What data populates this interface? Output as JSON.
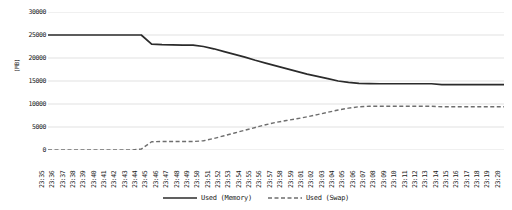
{
  "chart_data": {
    "type": "line",
    "title": "",
    "xlabel": "",
    "ylabel": "(MB)",
    "ylim": [
      0,
      30000
    ],
    "ytick_labels": [
      "30000",
      "25000",
      "20000",
      "15000",
      "10000",
      "5000",
      "0"
    ],
    "ytick_values": [
      30000,
      25000,
      20000,
      15000,
      10000,
      5000,
      0
    ],
    "grid": true,
    "legend_position": "bottom-center",
    "categories": [
      "23:35",
      "23:36",
      "23:37",
      "23:38",
      "23:39",
      "23:40",
      "23:41",
      "23:42",
      "23:43",
      "23:44",
      "23:45",
      "23:46",
      "23:47",
      "23:48",
      "23:49",
      "23:50",
      "23:51",
      "23:52",
      "23:53",
      "23:54",
      "23:55",
      "23:56",
      "23:57",
      "23:58",
      "23:59",
      "23:01",
      "23:02",
      "23:03",
      "23:04",
      "23:05",
      "23:06",
      "23:07",
      "23:08",
      "23:09",
      "23:10",
      "23:11",
      "23:12",
      "23:13",
      "23:14",
      "23:15",
      "23:16",
      "23:17",
      "23:18",
      "23:19",
      "23:20"
    ],
    "series": [
      {
        "name": "Used (Memory)",
        "style": "solid",
        "color": "#2b2b2b",
        "values": [
          25000,
          25000,
          25000,
          25000,
          25000,
          25000,
          25000,
          25000,
          25000,
          25000,
          23000,
          22900,
          22850,
          22800,
          22800,
          22500,
          22000,
          21400,
          20800,
          20200,
          19500,
          18900,
          18300,
          17700,
          17100,
          16500,
          16000,
          15500,
          15000,
          14700,
          14500,
          14450,
          14400,
          14400,
          14400,
          14400,
          14400,
          14400,
          14200,
          14200,
          14200,
          14200,
          14200,
          14200,
          14200
        ]
      },
      {
        "name": "Used (Swap)",
        "style": "dashed",
        "color": "#6e6e6e",
        "values": [
          0,
          0,
          0,
          0,
          0,
          0,
          0,
          0,
          0,
          200,
          1800,
          1850,
          1850,
          1850,
          1850,
          2000,
          2500,
          3100,
          3700,
          4300,
          4900,
          5500,
          6000,
          6400,
          6800,
          7200,
          7700,
          8200,
          8700,
          9100,
          9400,
          9500,
          9500,
          9500,
          9500,
          9500,
          9500,
          9500,
          9400,
          9400,
          9400,
          9400,
          9400,
          9400,
          9400
        ]
      }
    ]
  },
  "legend": {
    "items": [
      {
        "label": "Used (Memory)"
      },
      {
        "label": "Used (Swap)"
      }
    ]
  }
}
